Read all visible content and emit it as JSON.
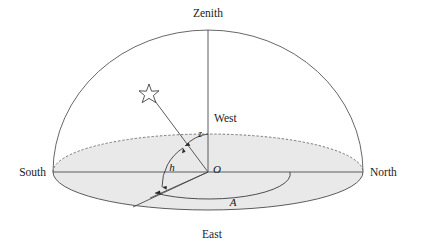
{
  "diagram": {
    "cardinal_labels": {
      "zenith": "Zenith",
      "north": "North",
      "south": "South",
      "east": "East",
      "west": "West"
    },
    "math_labels": {
      "origin": "O",
      "zenith_distance": "z",
      "altitude": "h",
      "azimuth": "A"
    },
    "object_labels": {
      "star": "star-symbol"
    },
    "colors": {
      "horizon_fill": "#e9e9e9",
      "outline": "#4a4a4a",
      "dome_outline": "#565656",
      "dashed_outline": "#6b6b6b",
      "text": "#1b1b1b",
      "background": "#ffffff"
    },
    "geometry": {
      "origin_x": 208,
      "origin_y": 172,
      "horizon_rx": 155,
      "horizon_ry": 38,
      "dome_rx": 155,
      "dome_ry": 142,
      "zenith_x": 208,
      "zenith_y": 30,
      "north_x": 363,
      "north_y": 172,
      "south_x": 53,
      "south_y": 172,
      "east_x": 133,
      "east_y": 207,
      "west_x": 208,
      "west_y": 134,
      "star_x": 149,
      "star_y": 93
    }
  }
}
